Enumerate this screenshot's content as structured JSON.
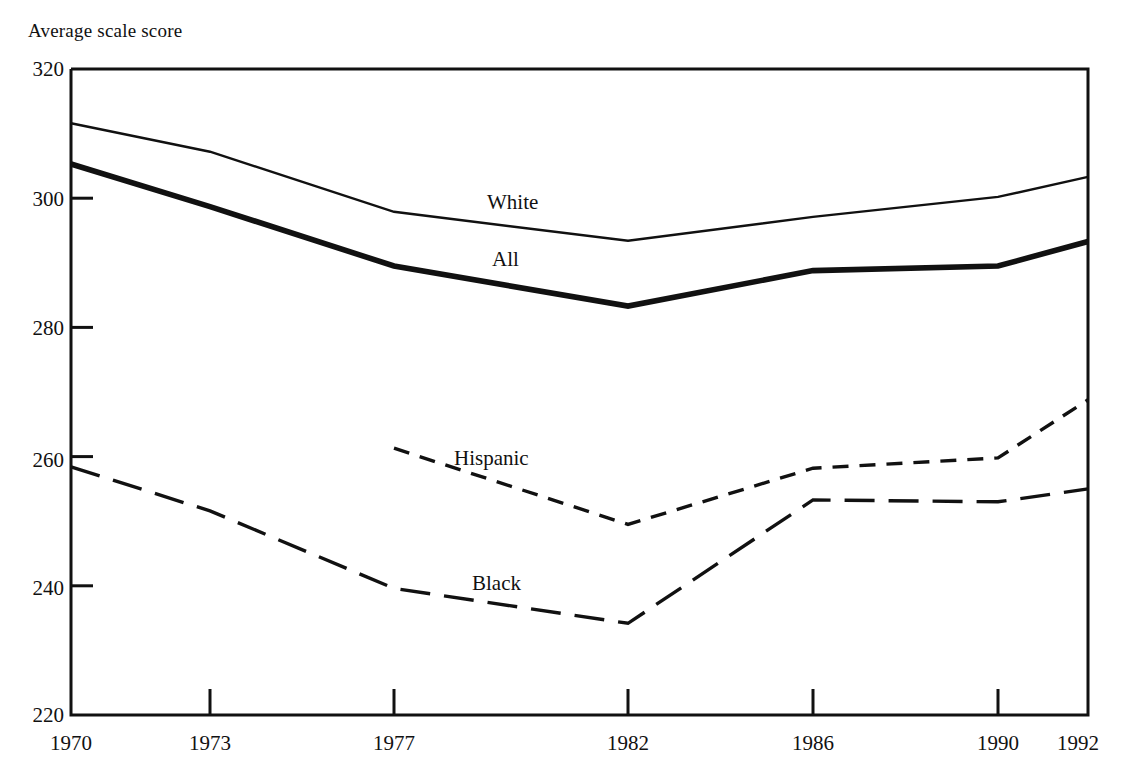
{
  "chart_data": {
    "type": "line",
    "title": "",
    "ylabel": "Average scale score",
    "xlabel": "",
    "ylim": [
      220,
      320
    ],
    "yticks": [
      220,
      240,
      260,
      280,
      300,
      320
    ],
    "xticks": [
      "1970",
      "1973",
      "1977",
      "1982",
      "1986",
      "1990",
      "1992"
    ],
    "x": [
      1970,
      1973,
      1977,
      1982,
      1986,
      1990,
      1992
    ],
    "grid": false,
    "legend_position": "inline-annotations",
    "series": [
      {
        "name": "White",
        "style": "solid-thin",
        "x": [
          1970,
          1973,
          1977,
          1982,
          1986,
          1990,
          1992
        ],
        "values": [
          311.6,
          307.2,
          297.9,
          293.4,
          297.1,
          300.2,
          303.3
        ]
      },
      {
        "name": "All",
        "style": "solid-thick",
        "x": [
          1970,
          1973,
          1977,
          1982,
          1986,
          1990,
          1992
        ],
        "values": [
          305.3,
          298.7,
          289.5,
          283.3,
          288.8,
          289.5,
          293.3
        ]
      },
      {
        "name": "Hispanic",
        "style": "dashed-short",
        "x": [
          1977,
          1982,
          1986,
          1990,
          1992
        ],
        "values": [
          261.3,
          249.5,
          258.2,
          259.8,
          268.8
        ]
      },
      {
        "name": "Black",
        "style": "dashed-long",
        "x": [
          1970,
          1973,
          1977,
          1982,
          1986,
          1990,
          1992
        ],
        "values": [
          258.4,
          251.6,
          239.6,
          234.2,
          253.3,
          253.0,
          255.0
        ]
      }
    ],
    "annotations": [
      {
        "text": "White",
        "x_px": 487,
        "y_px": 192
      },
      {
        "text": "All",
        "x_px": 492,
        "y_px": 249
      },
      {
        "text": "Hispanic",
        "x_px": 454,
        "y_px": 448
      },
      {
        "text": "Black",
        "x_px": 472,
        "y_px": 573
      }
    ],
    "colors": {
      "axis": "#111111",
      "line": "#111111",
      "background": "#ffffff"
    }
  },
  "axis": {
    "y_ticks": [
      {
        "label": "320"
      },
      {
        "label": "300"
      },
      {
        "label": "280"
      },
      {
        "label": "260"
      },
      {
        "label": "240"
      },
      {
        "label": "220"
      }
    ],
    "x_ticks": [
      {
        "label": "1970"
      },
      {
        "label": "1973"
      },
      {
        "label": "1977"
      },
      {
        "label": "1982"
      },
      {
        "label": "1986"
      },
      {
        "label": "1990"
      },
      {
        "label": "1992"
      }
    ]
  },
  "labels": {
    "y_axis_title": "Average scale score",
    "white": "White",
    "all": "All",
    "hispanic": "Hispanic",
    "black": "Black"
  }
}
